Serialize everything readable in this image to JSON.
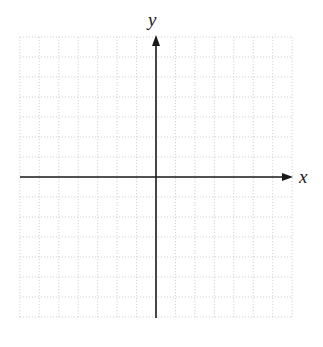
{
  "diagram": {
    "type": "coordinate-plane",
    "x_axis_label": "x",
    "y_axis_label": "y",
    "grid": {
      "cells_left": 7,
      "cells_right": 7,
      "cells_up": 7,
      "cells_down": 7,
      "style": "dotted",
      "color": "#c8c8c8"
    },
    "axis_color": "#1a1a1a",
    "arrows": {
      "x_positive": true,
      "x_negative": false,
      "y_positive": true,
      "y_negative": false
    }
  }
}
